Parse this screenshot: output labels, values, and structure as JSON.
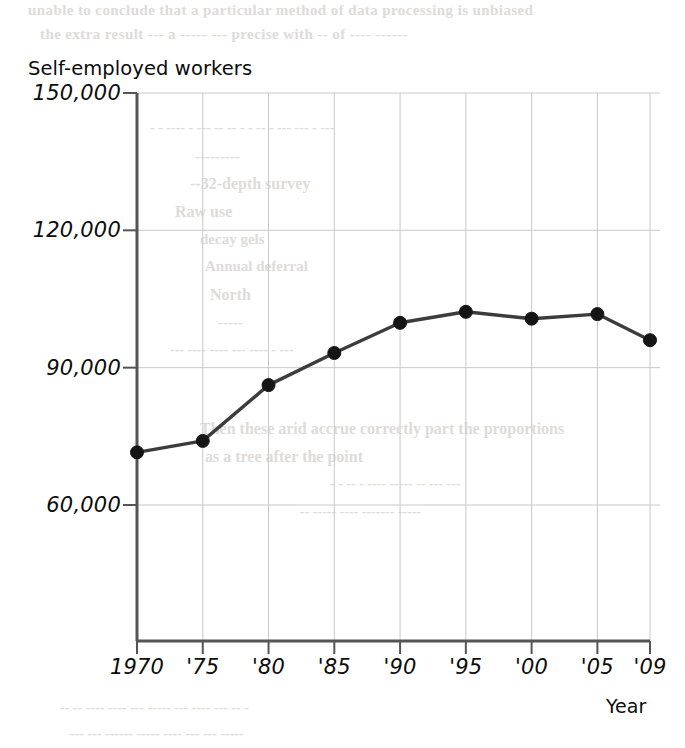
{
  "chart_data": {
    "type": "line",
    "title": "Self-employed workers",
    "xlabel": "Year",
    "ylabel": "",
    "x": [
      1970,
      1975,
      1980,
      1985,
      1990,
      1995,
      2000,
      2005,
      2009
    ],
    "xtick_labels": [
      "1970",
      "'75",
      "'80",
      "'85",
      "'90",
      "'95",
      "'00",
      "'05",
      "'09"
    ],
    "ytick_labels": [
      "150,000",
      "120,000",
      "90,000",
      "60,000"
    ],
    "ytick_values": [
      150000,
      120000,
      90000,
      60000
    ],
    "values": [
      71500,
      74000,
      86200,
      93200,
      99800,
      102200,
      100700,
      101700,
      96000
    ],
    "ylim": [
      45000,
      150000
    ],
    "xlim": [
      1970,
      2009
    ],
    "grid": true,
    "legend": "none",
    "series_color": "#3c3c3c",
    "marker_color": "#151515",
    "gridline_color": "#c8c8cc",
    "axis_color": "#555555"
  },
  "background_bleed": {
    "lines": [
      "unable to conclude that a particular method of data processing is unbiased",
      "the extra result   --- a   -----  --- precise  with  -- of ---- ------",
      "- - ---- - --- -- -- - - -- - --- --- -  ---",
      "---------",
      "--32-depth survey",
      "Raw use",
      "decay gels",
      "Annual deferral",
      "North",
      "-----",
      "--- ---- ---- --- ---- - ---",
      "Then these arid accrue correctly part the proportions",
      "as a tree after the point",
      "- - -- - ---- ----- -- --- ---",
      "-- ----- ---- ------- -----",
      "-- -- ---- ---- --- ----- --- ---- --- -- -",
      "--- --- ------ ----- ---- --- --- -----"
    ]
  }
}
